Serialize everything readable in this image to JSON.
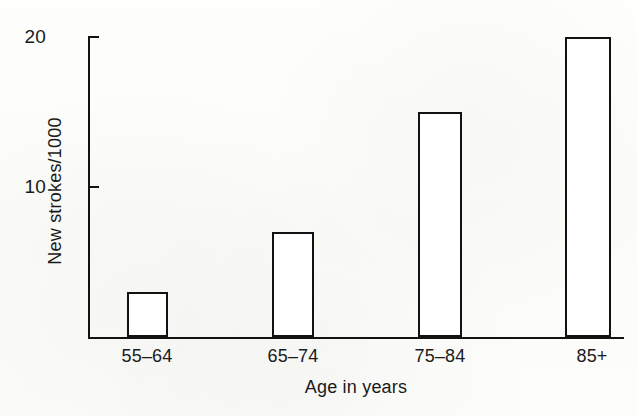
{
  "chart_data": {
    "type": "bar",
    "title": "",
    "xlabel": "Age in years",
    "ylabel": "New strokes/1000",
    "categories": [
      "55–64",
      "65–74",
      "75–84",
      "85+"
    ],
    "values": [
      3,
      7,
      15,
      20
    ],
    "ytick_labels": [
      "10",
      "20"
    ],
    "ytick_values": [
      10,
      20
    ],
    "ylim": [
      0,
      20.5
    ],
    "grid": false,
    "legend": null,
    "bar_style": {
      "fill": "#ffffff",
      "edge_color": "#121212",
      "edge_width_px": 2
    },
    "axis_color": "#121212",
    "background": "#fdfdfb",
    "annotations": []
  },
  "series_detail": [
    {
      "category": "55–64",
      "value": 3
    },
    {
      "category": "65–74",
      "value": 7
    },
    {
      "category": "75–84",
      "value": 15
    },
    {
      "category": "85+",
      "value": 20
    }
  ]
}
